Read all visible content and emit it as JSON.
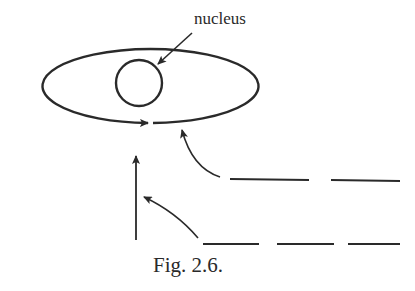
{
  "diagram": {
    "labels": {
      "nucleus": "nucleus"
    },
    "caption": "Fig. 2.6.",
    "colors": {
      "stroke": "#2a2a2a",
      "background": "#ffffff"
    },
    "elements": [
      {
        "type": "ellipse",
        "name": "orbit",
        "gap_near": "bottom-center",
        "arrow_direction": "right"
      },
      {
        "type": "circle",
        "name": "nucleus"
      },
      {
        "type": "arrow",
        "name": "nucleus-pointer",
        "from": "label",
        "to": "nucleus"
      },
      {
        "type": "dashed-line",
        "name": "upper-incoming-path",
        "curves_into": "orbit-gap"
      },
      {
        "type": "dashed-line",
        "name": "lower-incoming-path",
        "curves_into": "vertical-arrow"
      },
      {
        "type": "arrow",
        "name": "vertical-arrow",
        "direction": "up"
      }
    ]
  }
}
